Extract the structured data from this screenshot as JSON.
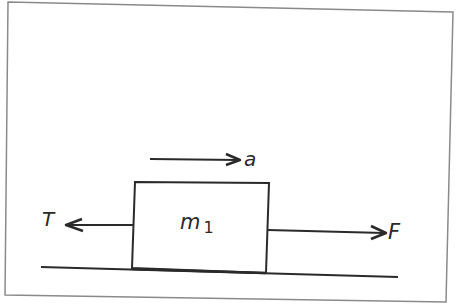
{
  "diagram": {
    "type": "free-body diagram",
    "labels": {
      "acceleration": "a",
      "tension": "T",
      "applied_force": "F",
      "mass": "m",
      "mass_subscript": "1"
    },
    "colors": {
      "ink": "#2a2a2a",
      "frame": "#8a8a8a",
      "background": "#ffffff"
    }
  }
}
